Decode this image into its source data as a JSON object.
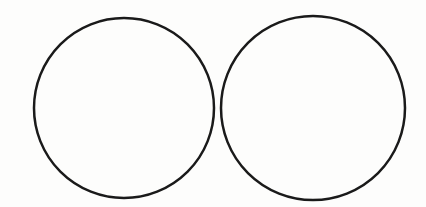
{
  "figure": {
    "background": "#fdfdfc",
    "stroke_color": "#1a1a1a",
    "stroke_width": 2.5,
    "shapes": [
      {
        "type": "circle",
        "label": "left-circle",
        "cx": 124,
        "cy": 108,
        "r": 90
      },
      {
        "type": "circle",
        "label": "right-circle",
        "cx": 313,
        "cy": 108,
        "r": 92
      }
    ]
  }
}
